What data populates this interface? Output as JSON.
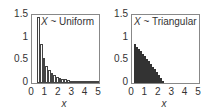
{
  "chart_data": [
    {
      "type": "bar",
      "title": "X ~ Uniform",
      "title_var": "X",
      "title_rest": "~ Uniform",
      "xlabel": "x",
      "ylabel": "",
      "xlim": [
        0,
        5
      ],
      "ylim": [
        0,
        1.5
      ],
      "xticks": [
        "0",
        "1",
        "2",
        "3",
        "4",
        "5"
      ],
      "yticks": [
        "0",
        "0.5",
        "1",
        "1.5"
      ],
      "bin_width": 0.2,
      "x": [
        0.5,
        0.7,
        0.9,
        1.1,
        1.3,
        1.5,
        1.7,
        1.9,
        2.1,
        2.3,
        2.5,
        2.7,
        2.9,
        3.1,
        3.3,
        3.5,
        3.7,
        3.9,
        4.1,
        4.3,
        4.5,
        4.7,
        4.9
      ],
      "values": [
        1.45,
        0.85,
        0.55,
        0.38,
        0.28,
        0.22,
        0.17,
        0.14,
        0.11,
        0.09,
        0.08,
        0.065,
        0.055,
        0.048,
        0.042,
        0.037,
        0.033,
        0.03,
        0.027,
        0.025,
        0.022,
        0.02,
        0.018
      ]
    },
    {
      "type": "bar",
      "title": "X ~ Triangular",
      "title_var": "X",
      "title_rest": "~ Triangular",
      "xlabel": "x",
      "ylabel": "",
      "xlim": [
        0,
        5
      ],
      "ylim": [
        0,
        1.5
      ],
      "xticks": [
        "0",
        "1",
        "2",
        "3",
        "4",
        "5"
      ],
      "yticks": [
        "0",
        "0.5",
        "1",
        "1.5"
      ],
      "bin_width": 0.15,
      "x": [
        0.2,
        0.35,
        0.5,
        0.65,
        0.8,
        0.95,
        1.1,
        1.25,
        1.4,
        1.55,
        1.7,
        1.85,
        2.0,
        2.15,
        2.3
      ],
      "values": [
        0.85,
        0.8,
        0.75,
        0.7,
        0.65,
        0.6,
        0.54,
        0.48,
        0.42,
        0.36,
        0.3,
        0.24,
        0.17,
        0.11,
        0.05
      ]
    }
  ]
}
